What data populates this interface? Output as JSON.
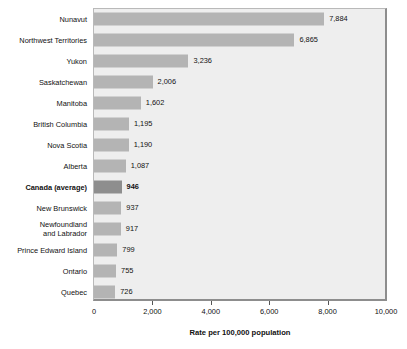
{
  "chart_data": {
    "type": "bar",
    "orientation": "horizontal",
    "title": "",
    "xlabel": "Rate per 100,000 population",
    "ylabel": "",
    "xlim": [
      0,
      10000
    ],
    "xticks": [
      0,
      2000,
      4000,
      6000,
      8000,
      10000
    ],
    "xtick_labels": [
      "0",
      "2,000",
      "4,000",
      "6,000",
      "8,000",
      "10,000"
    ],
    "grid": false,
    "legend": "none",
    "categories": [
      "Nunavut",
      "Northwest Territories",
      "Yukon",
      "Saskatchewan",
      "Manitoba",
      "British Columbia",
      "Nova Scotia",
      "Alberta",
      "Canada (average)",
      "New Brunswick",
      "Newfoundland\nand Labrador",
      "Prince Edward Island",
      "Ontario",
      "Quebec"
    ],
    "values": [
      7884,
      6865,
      3236,
      2006,
      1602,
      1195,
      1190,
      1087,
      946,
      937,
      917,
      799,
      755,
      726
    ],
    "value_labels": [
      "7,884",
      "6,865",
      "3,236",
      "2,006",
      "1,602",
      "1,195",
      "1,190",
      "1,087",
      "946",
      "937",
      "917",
      "799",
      "755",
      "726"
    ],
    "highlight_index": 8,
    "colors": {
      "bar": "#b4b4b4",
      "bar_highlight": "#8e8e8e",
      "plot_background": "#eeeeee",
      "plot_border": "#b9b9b9",
      "page_background": "#ffffff",
      "text": "#111111"
    }
  }
}
